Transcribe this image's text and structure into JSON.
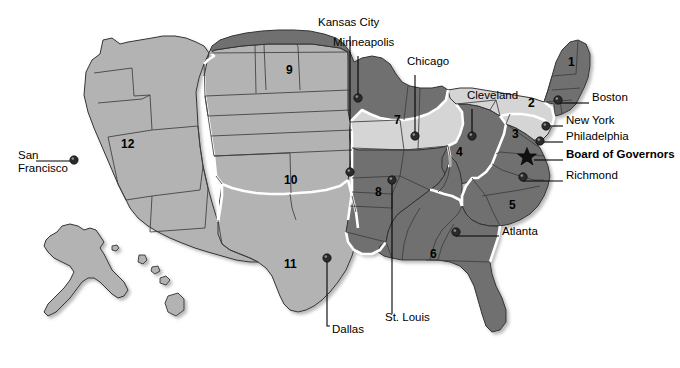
{
  "map": {
    "title": "Federal Reserve Districts and Bank Cities",
    "width": 680,
    "height": 368,
    "background": "#ffffff",
    "palette": {
      "light": "#d5d5d5",
      "medium": "#b3b3b3",
      "dark": "#707070",
      "outline": "#333333",
      "district_border": "#ffffff",
      "text": "#000000",
      "dot": "#2b2b2b",
      "leader": "#000000"
    }
  },
  "districts": [
    {
      "number": "1",
      "x": 575,
      "y": 62,
      "shade": "dark"
    },
    {
      "number": "2",
      "x": 535,
      "y": 103,
      "shade": "light"
    },
    {
      "number": "3",
      "x": 519,
      "y": 134,
      "shade": "light"
    },
    {
      "number": "4",
      "x": 463,
      "y": 152,
      "shade": "dark"
    },
    {
      "number": "5",
      "x": 516,
      "y": 205,
      "shade": "dark"
    },
    {
      "number": "6",
      "x": 437,
      "y": 254,
      "shade": "dark"
    },
    {
      "number": "7",
      "x": 401,
      "y": 120,
      "shade": "light"
    },
    {
      "number": "8",
      "x": 382,
      "y": 192,
      "shade": "dark"
    },
    {
      "number": "9",
      "x": 293,
      "y": 70,
      "shade": "dark"
    },
    {
      "number": "10",
      "x": 291,
      "y": 180,
      "shade": "medium"
    },
    {
      "number": "11",
      "x": 291,
      "y": 264,
      "shade": "medium"
    },
    {
      "number": "12",
      "x": 128,
      "y": 144,
      "shade": "medium"
    }
  ],
  "cities": [
    {
      "name": "San\nFrancisco",
      "label_x": 18,
      "label_y": 156,
      "align": "left",
      "bold": false,
      "dot_x": 74,
      "dot_y": 160,
      "leader": [
        [
          36,
          161
        ],
        [
          74,
          161
        ]
      ]
    },
    {
      "name": "Kansas City",
      "label_x": 318,
      "label_y": 23,
      "align": "left",
      "bold": false,
      "dot_x": 350,
      "dot_y": 172,
      "leader": [
        [
          350,
          36
        ],
        [
          350,
          172
        ]
      ]
    },
    {
      "name": "Minneapolis",
      "label_x": 333,
      "label_y": 43,
      "align": "left",
      "bold": false,
      "dot_x": 358,
      "dot_y": 98,
      "leader": [
        [
          358,
          56
        ],
        [
          358,
          98
        ]
      ]
    },
    {
      "name": "Chicago",
      "label_x": 407,
      "label_y": 62,
      "align": "left",
      "bold": false,
      "dot_x": 415,
      "dot_y": 136,
      "leader": [
        [
          415,
          75
        ],
        [
          415,
          136
        ]
      ]
    },
    {
      "name": "Cleveland",
      "label_x": 467,
      "label_y": 96,
      "align": "left",
      "bold": false,
      "dot_x": 472,
      "dot_y": 136,
      "leader": [
        [
          472,
          109
        ],
        [
          472,
          136
        ]
      ]
    },
    {
      "name": "Boston",
      "label_x": 592,
      "label_y": 98,
      "align": "left",
      "bold": false,
      "dot_x": 558,
      "dot_y": 100,
      "leader": [
        [
          558,
          103
        ],
        [
          589,
          103
        ]
      ]
    },
    {
      "name": "New York",
      "label_x": 566,
      "label_y": 121,
      "align": "left",
      "bold": false,
      "dot_x": 546,
      "dot_y": 126,
      "leader": [
        [
          546,
          126
        ],
        [
          563,
          126
        ]
      ]
    },
    {
      "name": "Philadelphia",
      "label_x": 566,
      "label_y": 137,
      "align": "left",
      "bold": false,
      "dot_x": 540,
      "dot_y": 141,
      "leader": [
        [
          540,
          142
        ],
        [
          563,
          142
        ]
      ]
    },
    {
      "name": "Board of Governors",
      "label_x": 566,
      "label_y": 155,
      "align": "left",
      "bold": true,
      "dot_x": 527,
      "dot_y": 157,
      "leader": [
        [
          534,
          160
        ],
        [
          563,
          160
        ]
      ]
    },
    {
      "name": "Richmond",
      "label_x": 566,
      "label_y": 176,
      "align": "left",
      "bold": false,
      "dot_x": 523,
      "dot_y": 177,
      "leader": [
        [
          523,
          181
        ],
        [
          563,
          181
        ]
      ]
    },
    {
      "name": "Atlanta",
      "label_x": 502,
      "label_y": 232,
      "align": "left",
      "bold": false,
      "dot_x": 456,
      "dot_y": 232,
      "leader": [
        [
          456,
          236
        ],
        [
          499,
          236
        ]
      ]
    },
    {
      "name": "St. Louis",
      "label_x": 385,
      "label_y": 318,
      "align": "left",
      "bold": false,
      "dot_x": 392,
      "dot_y": 180,
      "leader": [
        [
          392,
          180
        ],
        [
          392,
          314
        ]
      ]
    },
    {
      "name": "Dallas",
      "label_x": 332,
      "label_y": 330,
      "align": "left",
      "bold": false,
      "dot_x": 327,
      "dot_y": 258,
      "leader": [
        [
          327,
          258
        ],
        [
          327,
          326
        ],
        [
          330,
          326
        ]
      ]
    }
  ],
  "board_of_governors": {
    "marker": "star",
    "x": 527,
    "y": 157,
    "label": "Board of Governors"
  }
}
